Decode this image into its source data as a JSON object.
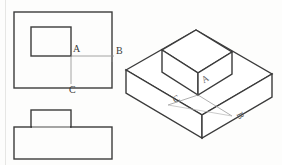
{
  "drawing": {
    "title": "Orthographic and isometric projection of a stepped block",
    "stroke_color": "#3b3b3b",
    "thin_stroke_color": "#8d8d8d",
    "page_edge_color": "#e2e2e0",
    "background": "#fdfdfc"
  },
  "views": {
    "top_view": {
      "name": "top-view",
      "outer_rect": {
        "x": 14,
        "y": 12,
        "width": 98,
        "height": 76
      },
      "inner_rect": {
        "x": 31,
        "y": 27,
        "width": 40,
        "height": 29
      }
    },
    "front_view": {
      "name": "front-view",
      "base_rect": {
        "x": 14,
        "y": 127,
        "width": 98,
        "height": 32
      },
      "step_rect": {
        "x": 31,
        "y": 110,
        "width": 40,
        "height": 17
      }
    },
    "isometric_view": {
      "name": "isometric-view",
      "base_top": "126,70 196,30 272,74 202,115",
      "base_front_left": "126,70 126,93 202,138 202,115",
      "base_front_right": "202,115 202,138 272,97 272,74",
      "block_top": "162,50 196,30 232,52 198,73",
      "block_front_left": "162,50 162,72 198,95 198,73",
      "block_front_right": "198,73 198,95 232,74 232,52"
    }
  },
  "labels": {
    "top_view": [
      {
        "key": "A",
        "text": "A",
        "x": 73,
        "y": 49,
        "name": "label-a-top-view"
      },
      {
        "key": "B",
        "text": "B",
        "x": 116,
        "y": 51,
        "name": "label-b-top-view"
      },
      {
        "key": "C",
        "text": "C",
        "x": 69,
        "y": 86,
        "name": "label-c-top-view"
      }
    ],
    "isometric_view": [
      {
        "key": "A",
        "text": "A",
        "x": 205,
        "y": 82,
        "name": "label-a-isometric"
      },
      {
        "key": "C",
        "text": "C",
        "x": 176,
        "y": 102,
        "name": "label-c-isometric"
      },
      {
        "key": "B",
        "text": "B",
        "x": 234,
        "y": 112,
        "name": "label-b-isometric"
      }
    ]
  },
  "dimension_lines": {
    "a_to_b": {
      "x1": 71,
      "y1": 56,
      "x2": 114,
      "y2": 56
    },
    "a_to_c": {
      "x1": 71,
      "y1": 56,
      "x2": 71,
      "y2": 84
    },
    "iso_a_to_c": {
      "x1": 198,
      "y1": 95,
      "x2": 168,
      "y2": 105
    },
    "iso_a_to_b": {
      "x1": 198,
      "y1": 95,
      "x2": 232,
      "y2": 116
    }
  }
}
